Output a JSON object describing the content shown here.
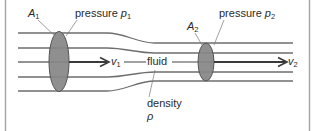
{
  "diagram": {
    "colors": {
      "frame": "#a8a8a8",
      "streamline": "#6e6e6e",
      "cross_section_fill": "#8f8f8f",
      "cross_section_stroke": "#555555",
      "text": "#2a2a2a",
      "arrow": "#3a3a3a"
    },
    "labels": {
      "area_1": {
        "symbol": "A",
        "subscript": "1"
      },
      "pressure_1": {
        "text": "pressure ",
        "symbol": "p",
        "subscript": "1"
      },
      "area_2": {
        "symbol": "A",
        "subscript": "2"
      },
      "pressure_2": {
        "text": "pressure ",
        "symbol": "p",
        "subscript": "2"
      },
      "velocity_1": {
        "symbol": "v",
        "subscript": "1"
      },
      "velocity_2": {
        "symbol": "v",
        "subscript": "2"
      },
      "fluid": "fluid",
      "density": "density",
      "density_symbol": "ρ"
    },
    "sections": [
      {
        "name": "wide-section",
        "area": "A1",
        "pressure": "p1",
        "velocity": "v1"
      },
      {
        "name": "narrow-section",
        "area": "A2",
        "pressure": "p2",
        "velocity": "v2"
      }
    ]
  }
}
